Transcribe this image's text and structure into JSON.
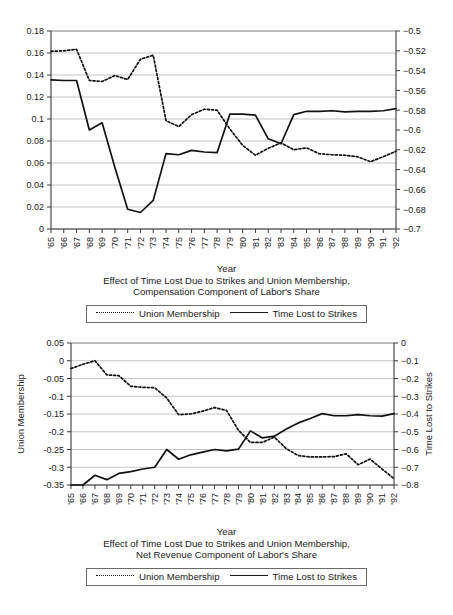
{
  "figures": [
    {
      "id": "compensation",
      "caption_lines": [
        "Year",
        "Effect of Time Lost Due to Strikes and Union Membership,",
        "Compensation Component of Labor's Share"
      ],
      "legend": [
        {
          "label": "Union Membership",
          "style": "dotted"
        },
        {
          "label": "Time Lost to Strikes",
          "style": "solid"
        }
      ]
    },
    {
      "id": "net-revenue",
      "caption_lines": [
        "Year",
        "Effect of Time Lost Due to Strikes and Union Membership,",
        "Net Revenue Component of Labor's Share"
      ],
      "legend": [
        {
          "label": "Union Membership",
          "style": "dotted"
        },
        {
          "label": "Time Lost to Strikes",
          "style": "solid"
        }
      ]
    }
  ],
  "chart_data": [
    {
      "type": "line",
      "id": "compensation-chart",
      "title": "Effect of Time Lost Due to Strikes and Union Membership, Compensation Component of Labor's Share",
      "xlabel": "Year",
      "ylabel_left": "",
      "ylabel_right": "",
      "grid": true,
      "legend_position": "bottom",
      "categories": [
        "'65",
        "'66",
        "'67",
        "'68",
        "'69",
        "'70",
        "'71",
        "'72",
        "'73",
        "'74",
        "'75",
        "'76",
        "'77",
        "'78",
        "'79",
        "'80",
        "'81",
        "'82",
        "'83",
        "'84",
        "'85",
        "'86",
        "'87",
        "'88",
        "'89",
        "'90",
        "'91",
        "'92"
      ],
      "left_axis": {
        "ticks": [
          "0",
          "0.02",
          "0.04",
          "0.06",
          "0.08",
          "0.1",
          "0.12",
          "0.14",
          "0.16",
          "0.18"
        ],
        "ylim": [
          0,
          0.18
        ]
      },
      "right_axis": {
        "ticks": [
          "-0.7",
          "-0.68",
          "-0.66",
          "-0.64",
          "-0.62",
          "-0.6",
          "-0.58",
          "-0.56",
          "-0.54",
          "-0.52",
          "-0.5"
        ],
        "ylim": [
          -0.7,
          -0.5
        ]
      },
      "series": [
        {
          "name": "Union Membership",
          "axis": "right",
          "style": "dotted",
          "values": [
            -0.5205,
            -0.52,
            -0.5185,
            -0.55,
            -0.551,
            -0.545,
            -0.549,
            -0.5285,
            -0.5245,
            -0.5905,
            -0.5965,
            -0.5845,
            -0.579,
            -0.58,
            -0.599,
            -0.6155,
            -0.6255,
            -0.6185,
            -0.613,
            -0.62,
            -0.618,
            -0.624,
            -0.625,
            -0.6255,
            -0.627,
            -0.632,
            -0.627,
            -0.6215
          ]
        },
        {
          "name": "Time Lost to Strikes",
          "axis": "left",
          "style": "solid",
          "values": [
            0.1355,
            0.135,
            0.135,
            0.09,
            0.0965,
            0.056,
            0.018,
            0.015,
            0.026,
            0.0685,
            0.0675,
            0.0715,
            0.07,
            0.0695,
            0.1045,
            0.1045,
            0.1035,
            0.082,
            0.0775,
            0.104,
            0.107,
            0.107,
            0.1075,
            0.1065,
            0.107,
            0.107,
            0.1075,
            0.1095
          ]
        }
      ]
    },
    {
      "type": "line",
      "id": "net-revenue-chart",
      "title": "Effect of Time Lost Due to Strikes and Union Membership, Net Revenue Component of Labor's Share",
      "xlabel": "Year",
      "ylabel_left": "Union Membership",
      "ylabel_right": "Time Lost to Strikes",
      "grid": true,
      "legend_position": "bottom",
      "categories": [
        "'65",
        "'66",
        "'67",
        "'68",
        "'69",
        "'70",
        "'71",
        "'72",
        "'73",
        "'74",
        "'75",
        "'76",
        "'77",
        "'78",
        "'79",
        "'80",
        "'81",
        "'82",
        "'83",
        "'84",
        "'85",
        "'86",
        "'87",
        "'88",
        "'89",
        "'90",
        "'91",
        "'92"
      ],
      "left_axis": {
        "ticks": [
          "-0.35",
          "-0.3",
          "-0.25",
          "-0.2",
          "-0.15",
          "-0.1",
          "-0.05",
          "0",
          "0.05"
        ],
        "ylim": [
          -0.35,
          0.05
        ]
      },
      "right_axis": {
        "ticks": [
          "-0.8",
          "-0.7",
          "-0.6",
          "-0.5",
          "-0.4",
          "-0.3",
          "-0.2",
          "-0.1",
          "0"
        ],
        "ylim": [
          -0.8,
          0
        ]
      },
      "series": [
        {
          "name": "Union Membership",
          "axis": "left",
          "style": "dotted",
          "values": [
            -0.022,
            -0.01,
            0.0,
            -0.04,
            -0.042,
            -0.072,
            -0.075,
            -0.076,
            -0.105,
            -0.152,
            -0.15,
            -0.142,
            -0.132,
            -0.14,
            -0.196,
            -0.23,
            -0.23,
            -0.215,
            -0.248,
            -0.267,
            -0.271,
            -0.271,
            -0.27,
            -0.262,
            -0.293,
            -0.277,
            -0.305,
            -0.332
          ]
        },
        {
          "name": "Time Lost to Strikes",
          "axis": "right",
          "style": "solid",
          "values": [
            -0.8,
            -0.8,
            -0.745,
            -0.77,
            -0.735,
            -0.725,
            -0.71,
            -0.7,
            -0.6,
            -0.655,
            -0.63,
            -0.615,
            -0.6,
            -0.608,
            -0.598,
            -0.495,
            -0.535,
            -0.525,
            -0.485,
            -0.45,
            -0.425,
            -0.398,
            -0.41,
            -0.41,
            -0.403,
            -0.41,
            -0.412,
            -0.398
          ]
        }
      ]
    }
  ]
}
